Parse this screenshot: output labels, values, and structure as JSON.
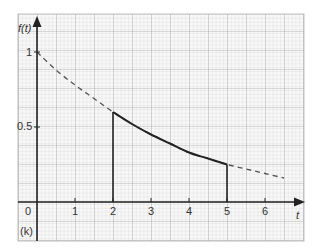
{
  "chart_data": {
    "type": "line",
    "title": "",
    "xlabel": "t",
    "ylabel": "f(t)",
    "panel_label": "(k)",
    "xlim": [
      0,
      6.8
    ],
    "ylim": [
      0,
      1.15
    ],
    "x_ticks": [
      "0",
      "1",
      "2",
      "3",
      "4",
      "5",
      "6"
    ],
    "y_ticks": [
      "0.5",
      "1"
    ],
    "grid": true,
    "series": [
      {
        "name": "f(t) full (dashed)",
        "style": "dashed",
        "x": [
          0,
          0.5,
          1,
          1.5,
          2,
          2.5,
          3,
          3.5,
          4,
          4.5,
          5,
          5.5,
          6,
          6.5
        ],
        "values": [
          1.0,
          0.88,
          0.78,
          0.69,
          0.6,
          0.52,
          0.45,
          0.39,
          0.33,
          0.29,
          0.25,
          0.22,
          0.19,
          0.16
        ]
      },
      {
        "name": "f(t) on [2,5] (solid)",
        "style": "solid",
        "x": [
          2,
          2.5,
          3,
          3.5,
          4,
          4.5,
          5
        ],
        "values": [
          0.6,
          0.52,
          0.45,
          0.39,
          0.33,
          0.29,
          0.25
        ]
      }
    ],
    "vertical_lines": [
      {
        "x": 2,
        "from": 0,
        "to": 0.6
      },
      {
        "x": 5,
        "from": 0,
        "to": 0.25
      }
    ]
  },
  "labels": {
    "y_axis": "f(t)",
    "x_axis": "t",
    "panel": "(k)",
    "tick_x": [
      "0",
      "1",
      "2",
      "3",
      "4",
      "5",
      "6"
    ],
    "tick_y_1": "1",
    "tick_y_05": "0.5"
  }
}
